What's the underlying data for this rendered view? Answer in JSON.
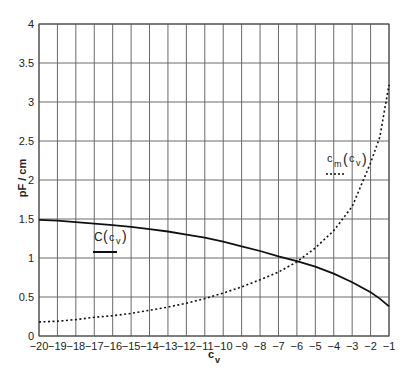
{
  "chart_data": {
    "type": "line",
    "title": "",
    "xlabel": "c_v",
    "ylabel": "pF / cm",
    "xlim": [
      -20,
      -1
    ],
    "ylim": [
      0,
      4
    ],
    "grid": true,
    "x_ticks": [
      -20,
      -19,
      -18,
      -17,
      -16,
      -15,
      -14,
      -13,
      -12,
      -11,
      -10,
      -9,
      -8,
      -7,
      -6,
      -5,
      -4,
      -3,
      -2,
      -1
    ],
    "y_ticks": [
      0,
      0.5,
      1,
      1.5,
      2,
      2.5,
      3,
      3.5,
      4
    ],
    "y_tick_labels": [
      "0",
      "0.5",
      "1",
      "1.5",
      "2",
      "2.5",
      "3",
      "3.5",
      "4"
    ],
    "x": [
      -20,
      -19,
      -18,
      -17,
      -16,
      -15,
      -14,
      -13,
      -12,
      -11,
      -10,
      -9,
      -8,
      -7,
      -6,
      -5,
      -4,
      -3,
      -2,
      -1.5,
      -1
    ],
    "series": [
      {
        "name": "C(c_v)",
        "style": "solid",
        "values": [
          1.49,
          1.48,
          1.46,
          1.44,
          1.42,
          1.4,
          1.37,
          1.34,
          1.3,
          1.26,
          1.21,
          1.15,
          1.09,
          1.02,
          0.96,
          0.89,
          0.8,
          0.69,
          0.56,
          0.48,
          0.38
        ]
      },
      {
        "name": "c_m(c_v)",
        "style": "dotted",
        "values": [
          0.18,
          0.19,
          0.21,
          0.24,
          0.26,
          0.29,
          0.33,
          0.37,
          0.42,
          0.48,
          0.55,
          0.63,
          0.72,
          0.82,
          0.95,
          1.13,
          1.35,
          1.66,
          2.22,
          2.55,
          3.22
        ]
      }
    ],
    "annotations": [
      {
        "text": "C(c_v)",
        "attached_to": "C(c_v)",
        "x": -16.5,
        "y": 1.2
      },
      {
        "text": "c_m(c_v)",
        "attached_to": "c_m(c_v)",
        "x": -2.8,
        "y": 2.25
      }
    ],
    "legend_position": "inline labels"
  },
  "labels": {
    "ylabel": "pF / cm",
    "xlabel_main": "c",
    "xlabel_sub": "v",
    "legend_c_main": "C",
    "legend_c_sub": "v",
    "legend_cm_main": "c",
    "legend_cm_m": "m",
    "legend_cm_sub": "v"
  }
}
